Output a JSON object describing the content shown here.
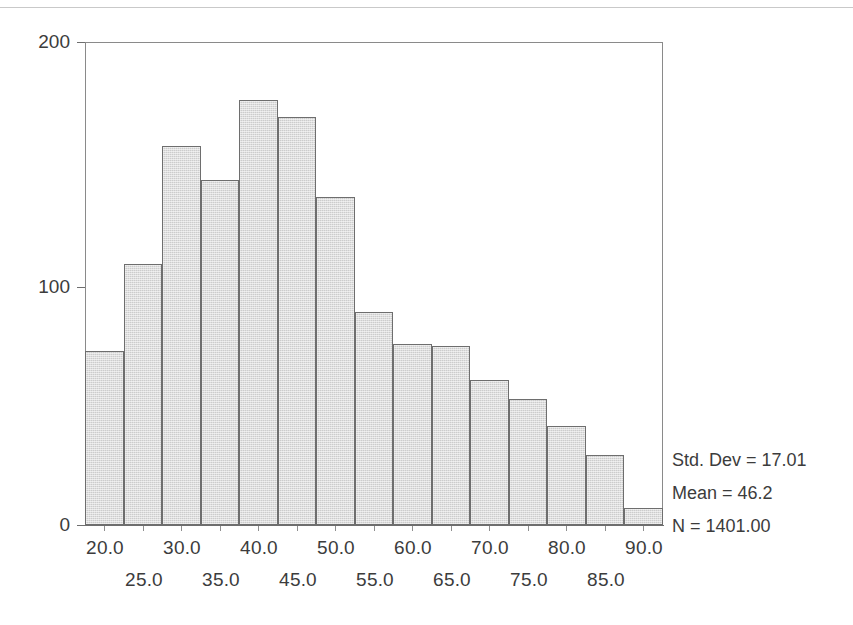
{
  "chart_data": {
    "type": "bar",
    "chart_subtype": "histogram",
    "title": "",
    "subtitle": "",
    "xlabel": "",
    "ylabel": "",
    "grid": false,
    "legend_position": "none",
    "xlim": [
      17.5,
      92.5
    ],
    "ylim": [
      0,
      200
    ],
    "bin_width": 5,
    "bar_color": "#cccccc",
    "bar_edge_color": "#6e6e6e",
    "y_ticks": [
      "200",
      "100",
      "0"
    ],
    "y_tick_values": [
      200,
      100,
      0
    ],
    "x_tick_labels_top_row": [
      "20.0",
      "30.0",
      "40.0",
      "50.0",
      "60.0",
      "70.0",
      "80.0",
      "90.0"
    ],
    "x_tick_labels_bottom_row": [
      "25.0",
      "35.0",
      "45.0",
      "55.0",
      "65.0",
      "75.0",
      "85.0"
    ],
    "x_tick_values": [
      20,
      25,
      30,
      35,
      40,
      45,
      50,
      55,
      60,
      65,
      70,
      75,
      80,
      85,
      90
    ],
    "bin_centers": [
      20,
      25,
      30,
      35,
      40,
      45,
      50,
      55,
      60,
      65,
      70,
      75,
      80,
      85,
      90
    ],
    "bin_ranges": [
      "17.5-22.5",
      "22.5-27.5",
      "27.5-32.5",
      "32.5-37.5",
      "37.5-42.5",
      "42.5-47.5",
      "47.5-52.5",
      "52.5-57.5",
      "57.5-62.5",
      "62.5-67.5",
      "67.5-72.5",
      "72.5-77.5",
      "77.5-82.5",
      "82.5-87.5",
      "87.5-92.5"
    ],
    "categories": [
      "20.0",
      "25.0",
      "30.0",
      "35.0",
      "40.0",
      "45.0",
      "50.0",
      "55.0",
      "60.0",
      "65.0",
      "70.0",
      "75.0",
      "80.0",
      "85.0",
      "90.0"
    ],
    "values": [
      72,
      108,
      157,
      143,
      176,
      169,
      136,
      88,
      75,
      74,
      60,
      52,
      41,
      29,
      7
    ]
  },
  "annotations": {
    "std_dev": "Std. Dev = 17.01",
    "mean": "Mean = 46.2",
    "n": "N = 1401.00"
  }
}
